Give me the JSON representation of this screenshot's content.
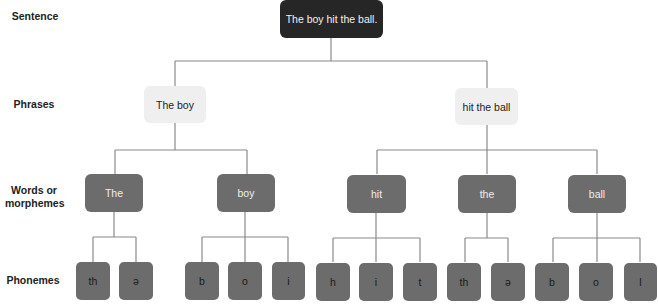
{
  "row_labels": {
    "sentence": "Sentence",
    "phrases": "Phrases",
    "words": "Words or morphemes",
    "words_line1": "Words or",
    "words_line2": "morphemes",
    "phonemes": "Phonemes"
  },
  "tree": {
    "sentence": "The boy hit the ball.",
    "phrases": [
      "The boy",
      "hit the ball"
    ],
    "words": [
      "The",
      "boy",
      "hit",
      "the",
      "ball"
    ],
    "phonemes": [
      [
        "th",
        "ə"
      ],
      [
        "b",
        "o",
        "i"
      ],
      [
        "h",
        "i",
        "t"
      ],
      [
        "th",
        "ə"
      ],
      [
        "b",
        "o",
        "l"
      ]
    ]
  },
  "colors": {
    "sentence_bg": "#262626",
    "phrase_bg": "#efefef",
    "word_bg": "#6c6c6c",
    "phoneme_bg": "#6c6c6c",
    "line": "#8a8a8a"
  }
}
